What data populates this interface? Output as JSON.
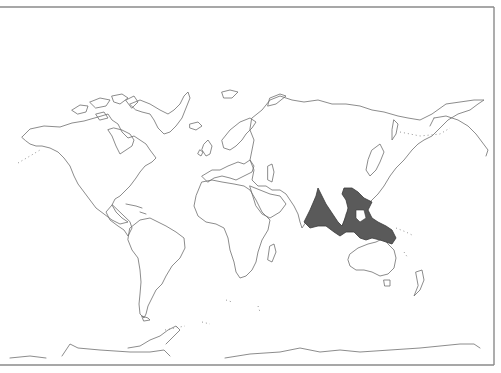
{
  "map": {
    "type": "world-outline-distribution-map",
    "projection": "equirectangular-style world outline",
    "colors": {
      "background": "#ffffff",
      "coastline": "#6e6e6e",
      "distribution_fill": "#5a5a5a",
      "frame": "#8a8a8a"
    },
    "highlighted_region": {
      "description": "Shaded distribution range across South & Southeast Asia to New Guinea",
      "areas": [
        "India (east coast)",
        "Sri Lanka",
        "Bay of Bengal",
        "Indochina",
        "Malay Peninsula",
        "Sumatra",
        "Borneo",
        "Java",
        "Sulawesi",
        "Philippines (south)",
        "New Guinea"
      ]
    },
    "labels": []
  }
}
